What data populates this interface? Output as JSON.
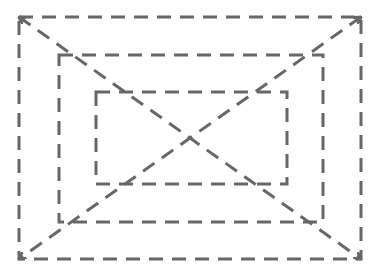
{
  "diagram": {
    "title_cropped": "",
    "stroke_color": "#676767",
    "stroke_width": 3,
    "dash": "14 9",
    "rectangles": [
      {
        "name": "outer",
        "x": 19,
        "y": 17,
        "w": 342,
        "h": 242
      },
      {
        "name": "middle",
        "x": 59,
        "y": 55,
        "w": 264,
        "h": 167
      },
      {
        "name": "inner",
        "x": 96,
        "y": 92,
        "w": 191,
        "h": 92
      }
    ],
    "diagonals": [
      {
        "name": "top-left-to-bottom-right",
        "x1": 19,
        "y1": 17,
        "x2": 361,
        "y2": 259,
        "arrows": "both"
      },
      {
        "name": "top-right-to-bottom-left",
        "x1": 361,
        "y1": 17,
        "x2": 19,
        "y2": 259,
        "arrows": "both"
      }
    ]
  }
}
